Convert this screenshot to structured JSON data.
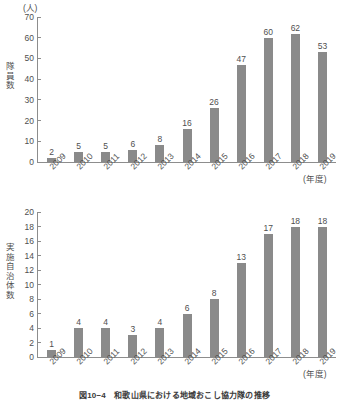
{
  "figure": {
    "caption": "図10−4　和歌山県における地域おこし協力隊の推移"
  },
  "chart_data": [
    {
      "id": "chart-top",
      "type": "bar",
      "title": "",
      "unit_label": "(人)",
      "ylabel": "隊員数",
      "xlabel": "(年度)",
      "categories": [
        "2009",
        "2010",
        "2011",
        "2012",
        "2013",
        "2014",
        "2015",
        "2016",
        "2017",
        "2018",
        "2019"
      ],
      "values": [
        2,
        5,
        5,
        6,
        8,
        16,
        26,
        47,
        60,
        62,
        53
      ],
      "yticks": [
        0,
        10,
        20,
        30,
        40,
        50,
        60,
        70
      ],
      "ylim": [
        0,
        70
      ],
      "grid": false,
      "legend": "none",
      "bar_color": "#8a8a8a"
    },
    {
      "id": "chart-bottom",
      "type": "bar",
      "title": "",
      "unit_label": "",
      "ylabel": "実施自治体数",
      "xlabel": "(年度)",
      "categories": [
        "2009",
        "2010",
        "2011",
        "2012",
        "2013",
        "2014",
        "2015",
        "2016",
        "2017",
        "2018",
        "2019"
      ],
      "values": [
        1,
        4,
        4,
        3,
        4,
        6,
        8,
        13,
        17,
        18,
        18
      ],
      "yticks": [
        0,
        2,
        4,
        6,
        8,
        10,
        12,
        14,
        16,
        18,
        20
      ],
      "ylim": [
        0,
        20
      ],
      "grid": false,
      "legend": "none",
      "bar_color": "#8a8a8a"
    }
  ]
}
